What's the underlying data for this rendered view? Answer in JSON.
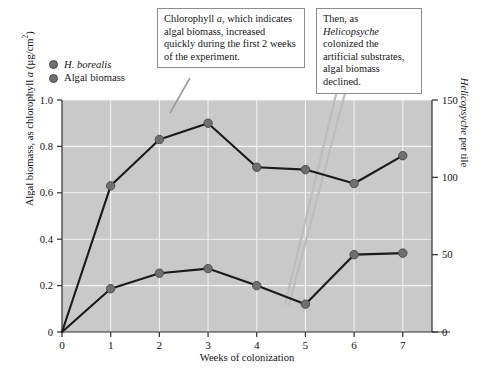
{
  "callouts": [
    {
      "id": "chlorophyll",
      "text_parts": [
        "Chlorophyll ",
        "a",
        ", which indicates algal biomass, increased quickly during the first 2 weeks of the experiment."
      ],
      "text": "Chlorophyll a, which indicates algal biomass, increased quickly during the first 2 weeks of the experiment."
    },
    {
      "id": "helicopsyche",
      "text_parts": [
        "Then, as ",
        "Helicopsyche",
        " colonized the artificial substrates, algal biomass declined."
      ],
      "text": "Then, as Helicopsyche colonized the artificial substrates, algal biomass declined."
    }
  ],
  "legend": {
    "items": [
      {
        "label": "H. borealis",
        "italic": true,
        "color": "#6f6f6f"
      },
      {
        "label": "Algal biomass",
        "italic": false,
        "color": "#6f6f6f"
      }
    ]
  },
  "chart_data": {
    "type": "line",
    "title": "",
    "xlabel": "Weeks of colonization",
    "ylabel": "Algal biomass, as chlorophyll a (µg/cm²)",
    "ylabel_right": "Helicopsyche per tile",
    "x": [
      0,
      1,
      2,
      3,
      4,
      5,
      6,
      7
    ],
    "xlim": [
      0,
      7.6
    ],
    "xticks": [
      "0",
      "1",
      "2",
      "3",
      "4",
      "5",
      "6",
      "7"
    ],
    "xtick_values": [
      0,
      1,
      2,
      3,
      4,
      5,
      6,
      7
    ],
    "ylim": [
      0,
      1.0
    ],
    "yticks": [
      "0",
      "0.2",
      "0.4",
      "0.6",
      "0.8",
      "1.0"
    ],
    "ytick_values": [
      0,
      0.2,
      0.4,
      0.6,
      0.8,
      1.0
    ],
    "ylim_right": [
      0,
      150
    ],
    "yticks_right": [
      "0",
      "50",
      "100",
      "150"
    ],
    "ytick_values_right": [
      0,
      50,
      100,
      150
    ],
    "grid": true,
    "legend_position": "above-plot-left",
    "plot_background": "#c9c9c9",
    "series": [
      {
        "name": "Algal biomass",
        "axis": "left",
        "units": "µg/cm²",
        "color": "#1a1a1a",
        "marker_color": "#6f6f6f",
        "values": [
          0.0,
          0.63,
          0.83,
          0.9,
          0.71,
          0.7,
          0.64,
          0.76
        ]
      },
      {
        "name": "H. borealis",
        "axis": "right",
        "units": "per tile",
        "color": "#1a1a1a",
        "marker_color": "#6f6f6f",
        "values": [
          0,
          28,
          38,
          41,
          30,
          18,
          50,
          51
        ]
      }
    ]
  }
}
